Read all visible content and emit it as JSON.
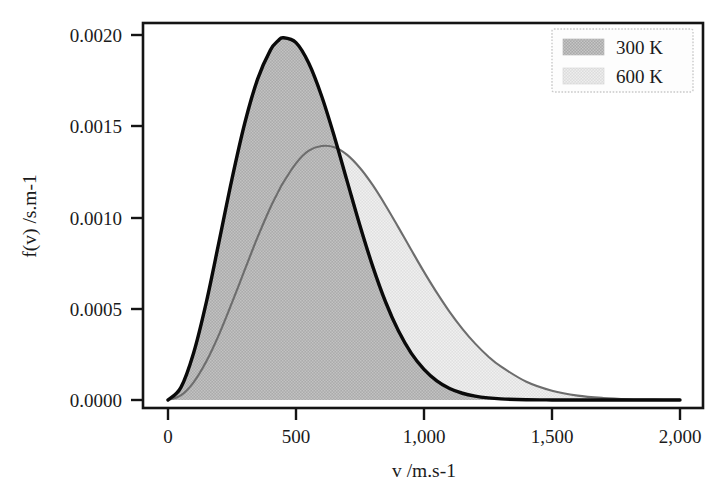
{
  "chart_data": {
    "type": "line",
    "title": "",
    "subtitle": "",
    "xlabel": "v /m.s-1",
    "ylabel": "f(v) /s.m-1",
    "xlim": [
      0,
      2000
    ],
    "ylim": [
      0.0,
      0.002
    ],
    "xticks": [
      0,
      500,
      1000,
      1500,
      2000
    ],
    "xtick_labels": [
      "0",
      "500",
      "1,000",
      "1,500",
      "2,000"
    ],
    "yticks": [
      0.0,
      0.0005,
      0.001,
      0.0015,
      0.002
    ],
    "ytick_labels": [
      "0.0000",
      "0.0005",
      "0.0010",
      "0.0015",
      "0.0020"
    ],
    "grid": false,
    "legend_position": "top-right",
    "legend_entries": [
      "300 K",
      "600 K"
    ],
    "annotation": "Maxwell-Boltzmann molecular speed distributions, filled under curve",
    "x": [
      0,
      50,
      100,
      150,
      200,
      250,
      300,
      350,
      400,
      430,
      450,
      500,
      550,
      600,
      650,
      700,
      750,
      800,
      850,
      900,
      950,
      1000,
      1050,
      1100,
      1150,
      1200,
      1250,
      1300,
      1400,
      1500,
      1600,
      1700,
      1800,
      1900,
      2000
    ],
    "series": [
      {
        "name": "300 K",
        "color": "#0a0a0a",
        "fill_color": "#b0b0b0",
        "peak_x": 430,
        "peak_y": 0.00197,
        "values": [
          0.0,
          6.8e-05,
          0.000258,
          0.000538,
          0.000872,
          0.001212,
          0.001518,
          0.001758,
          0.001917,
          0.001968,
          0.001985,
          0.001958,
          0.001845,
          0.001666,
          0.001443,
          0.001198,
          0.000955,
          0.000731,
          0.000537,
          0.000379,
          0.000257,
          0.000168,
          0.000105,
          6.3e-05,
          3.7e-05,
          2.1e-05,
          1.14e-05,
          6e-06,
          1.5e-06,
          3e-07,
          6e-08,
          1e-08,
          0.0,
          0.0,
          0.0
        ]
      },
      {
        "name": "600 K",
        "color": "#6d6d6d",
        "fill_color": "#dcdcdc",
        "peak_x": 613,
        "peak_y": 0.00139,
        "values": [
          0.0,
          2.5e-05,
          9.7e-05,
          0.000212,
          0.000361,
          0.000533,
          0.000714,
          0.000892,
          0.001055,
          0.001139,
          0.001191,
          0.001297,
          0.001366,
          0.001392,
          0.001385,
          0.001343,
          0.001271,
          0.001177,
          0.001066,
          0.000946,
          0.000823,
          0.000702,
          0.000588,
          0.000483,
          0.00039,
          0.000309,
          0.00024,
          0.000184,
          0.0001,
          5.1e-05,
          2.4e-05,
          1.1e-05,
          4.5e-06,
          1.8e-06,
          7e-07
        ]
      }
    ]
  },
  "axes": {
    "x_axis_name": "v /m.s-1",
    "y_axis_name": "f(v) /s.m-1"
  },
  "legend": {
    "items": [
      {
        "label": "300 K",
        "swatch": "#b0b0b0"
      },
      {
        "label": "600 K",
        "swatch": "#dedede"
      }
    ]
  },
  "page": {
    "scan_artifact_text": ""
  }
}
